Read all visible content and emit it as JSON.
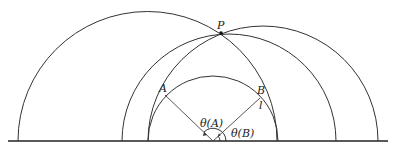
{
  "diagram": {
    "type": "geometry",
    "labels": {
      "P": "P",
      "A": "A",
      "B": "B",
      "l": "l",
      "theta_A": "θ(A)",
      "theta_B": "θ(B)"
    },
    "colors": {
      "stroke": "#333333",
      "background": "#ffffff"
    }
  }
}
